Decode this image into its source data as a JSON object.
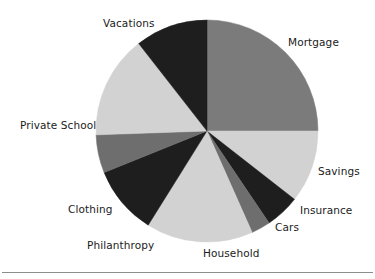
{
  "chart_data": {
    "type": "pie",
    "title": "",
    "subtitle": "",
    "xlabel": "",
    "ylabel": "",
    "legend_position": "none",
    "labels_position": "outside-callout",
    "grid": false,
    "start_angle_deg": 0,
    "direction": "clockwise",
    "center": {
      "x": 207,
      "y": 131
    },
    "radius": 111,
    "categories": [
      "Mortgage",
      "Savings",
      "Insurance",
      "Cars",
      "Household",
      "Philanthropy",
      "Clothing",
      "Private School",
      "Vacations"
    ],
    "values": [
      25.0,
      10.5,
      5.0,
      2.8,
      15.5,
      10.0,
      5.5,
      15.0,
      10.7
    ],
    "value_unit": "percent",
    "slices": [
      {
        "label": "Mortgage",
        "value": 25.0,
        "start_deg": 0,
        "end_deg": 90,
        "sweep_deg": 90,
        "color": "#7b7b7b",
        "tone": "medium-gray"
      },
      {
        "label": "Savings",
        "value": 10.5,
        "start_deg": 90,
        "end_deg": 128,
        "sweep_deg": 38,
        "color": "#d2d2d2",
        "tone": "light-gray"
      },
      {
        "label": "Insurance",
        "value": 5.0,
        "start_deg": 128,
        "end_deg": 146,
        "sweep_deg": 18,
        "color": "#1e1e1e",
        "tone": "near-black"
      },
      {
        "label": "Cars",
        "value": 2.8,
        "start_deg": 146,
        "end_deg": 156,
        "sweep_deg": 10,
        "color": "#6e6e6e",
        "tone": "medium-gray"
      },
      {
        "label": "Household",
        "value": 15.5,
        "start_deg": 156,
        "end_deg": 212,
        "sweep_deg": 56,
        "color": "#d2d2d2",
        "tone": "light-gray"
      },
      {
        "label": "Philanthropy",
        "value": 10.0,
        "start_deg": 212,
        "end_deg": 248,
        "sweep_deg": 36,
        "color": "#1e1e1e",
        "tone": "near-black"
      },
      {
        "label": "Clothing",
        "value": 5.5,
        "start_deg": 248,
        "end_deg": 268,
        "sweep_deg": 20,
        "color": "#6e6e6e",
        "tone": "medium-gray"
      },
      {
        "label": "Private School",
        "value": 15.0,
        "start_deg": 268,
        "end_deg": 322,
        "sweep_deg": 54,
        "color": "#d2d2d2",
        "tone": "light-gray"
      },
      {
        "label": "Vacations",
        "value": 10.7,
        "start_deg": 322,
        "end_deg": 360,
        "sweep_deg": 38,
        "color": "#1e1e1e",
        "tone": "near-black"
      }
    ]
  },
  "labels": {
    "mortgage": "Mortgage",
    "savings": "Savings",
    "insurance": "Insurance",
    "cars": "Cars",
    "household": "Household",
    "philanthropy": "Philanthropy",
    "clothing": "Clothing",
    "private_school": "Private School",
    "vacations": "Vacations"
  },
  "colors": {
    "background": "#ffffff",
    "text": "#1b1b1b",
    "rule": "#8d8d8d",
    "light_gray": "#d2d2d2",
    "medium_gray": "#7b7b7b",
    "near_black": "#1e1e1e"
  }
}
